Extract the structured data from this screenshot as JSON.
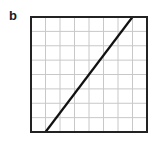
{
  "panel": {
    "label": "b"
  },
  "chart_data": {
    "type": "line",
    "title": "",
    "xlabel": "",
    "ylabel": "",
    "grid": true,
    "grid_divisions": {
      "x": 8,
      "y": 8
    },
    "xlim": [
      0,
      8
    ],
    "ylim": [
      0,
      8
    ],
    "series": [
      {
        "name": "line",
        "x": [
          1,
          7
        ],
        "y": [
          0,
          8
        ]
      }
    ],
    "colors": {
      "line": "#111111",
      "frame": "#222222",
      "grid": "#c8c8c8"
    }
  }
}
